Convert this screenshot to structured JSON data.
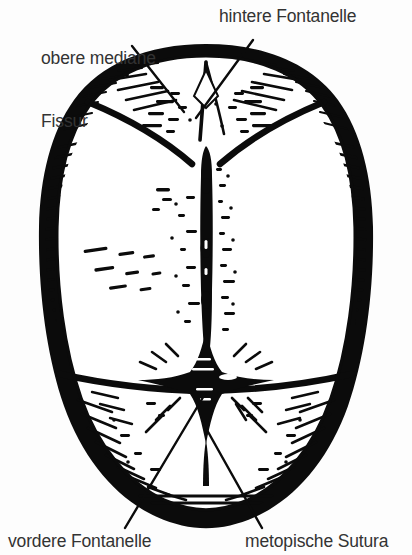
{
  "figure": {
    "kind": "anatomical-illustration",
    "style": "woodcut engraving, black ink on white",
    "background_color": "#fdfdfd",
    "ink_color": "#000000",
    "text_color": "#333333",
    "width": 412,
    "height": 555
  },
  "labels": {
    "superior_median_fissure": {
      "line1": "obere mediane",
      "line2": "Fissur"
    },
    "posterior_fontanelle": "hintere Fontanelle",
    "anterior_fontanelle": "vordere Fontanelle",
    "metopic_suture": "metopische Sutura"
  },
  "structures": {
    "cranial_outline": "oval vault outline with dense hatched shading",
    "sagittal_suture": "vertical midline suture",
    "coronal_suture": "transverse suture band across lower third",
    "lambdoid_sutures": "paired oblique sutures near vertex",
    "anterior_fontanelle": "star-shaped diamond at suture junction",
    "posterior_fontanelle": "small triangular gap at vertex"
  },
  "leaders": {
    "to_superior_median_fissure": "upper-left pointer",
    "to_posterior_fontanelle": "upper-right pointer",
    "to_anterior_fontanelle": "lower-left pointer",
    "to_metopic_suture": "lower-right pointer"
  }
}
